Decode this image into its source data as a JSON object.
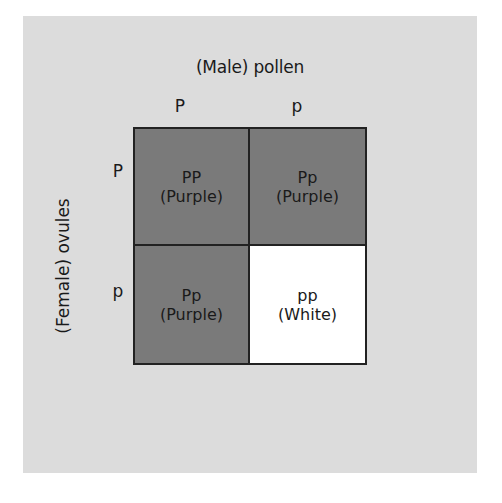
{
  "diagram": {
    "type": "punnett-square",
    "column_title": "(Male) pollen",
    "row_title": "(Female) ovules",
    "column_alleles": [
      "P",
      "p"
    ],
    "row_alleles": [
      "P",
      "p"
    ],
    "cells": [
      [
        {
          "genotype": "PP",
          "phenotype": "(Purple)",
          "color": "#7a7a7a"
        },
        {
          "genotype": "Pp",
          "phenotype": "(Purple)",
          "color": "#7a7a7a"
        }
      ],
      [
        {
          "genotype": "Pp",
          "phenotype": "(Purple)",
          "color": "#7a7a7a"
        },
        {
          "genotype": "pp",
          "phenotype": "(White)",
          "color": "#ffffff"
        }
      ]
    ],
    "colors": {
      "panel_background": "#dcdcdc",
      "border": "#222222",
      "purple_cell": "#7a7a7a",
      "white_cell": "#ffffff"
    }
  }
}
